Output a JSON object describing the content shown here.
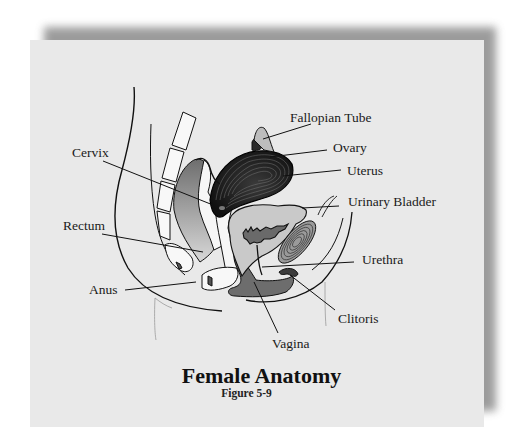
{
  "figure": {
    "title": "Female Anatomy",
    "subtitle": "Figure 5-9",
    "colors": {
      "background": "#ffffff",
      "card": "#e9e9e9",
      "shadow": "#8a8a8a",
      "line": "#111111",
      "dark_organ": "#1c1c1c",
      "mid_gray": "#7a7a7a",
      "light_gray": "#c9c9c9",
      "bone": "#f7f7f7"
    }
  },
  "labels": [
    {
      "id": "fallopian-tube",
      "text": "Fallopian Tube"
    },
    {
      "id": "ovary",
      "text": "Ovary"
    },
    {
      "id": "uterus",
      "text": "Uterus"
    },
    {
      "id": "cervix",
      "text": "Cervix"
    },
    {
      "id": "urinary-bladder",
      "text": "Urinary Bladder"
    },
    {
      "id": "rectum",
      "text": "Rectum"
    },
    {
      "id": "urethra",
      "text": "Urethra"
    },
    {
      "id": "anus",
      "text": "Anus"
    },
    {
      "id": "clitoris",
      "text": "Clitoris"
    },
    {
      "id": "vagina",
      "text": "Vagina"
    }
  ]
}
